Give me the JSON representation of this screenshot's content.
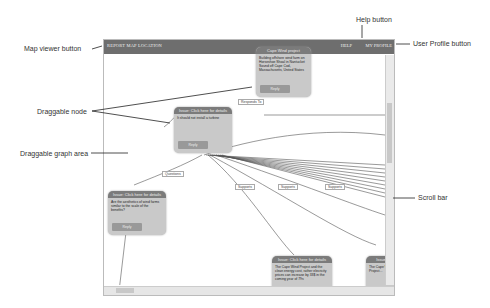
{
  "annotations": {
    "map_viewer": "Map viewer button",
    "help": "Help button",
    "user_profile": "User Profile button",
    "draggable_node": "Draggable node",
    "draggable_area": "Draggable graph area",
    "scroll_bar": "Scroll bar"
  },
  "topbar": {
    "left_button": "REPORT MAP LOCATION",
    "help": "HELP",
    "profile": "MY PROFILE"
  },
  "nodes": [
    {
      "title": "Cape Wind project",
      "body": "Building offshore wind farm on Horseshoe Shoal in Nantucket Sound off Cape Cod, Massachusetts, United States",
      "button": "Reply"
    },
    {
      "title": "Issue: Click here for details",
      "body": "It should not install a turbine",
      "button": "Reply"
    },
    {
      "title": "Issue: Click here for details",
      "body": "Are the aesthetics of wind farms similar to the scale of the benefits?",
      "button": "Reply"
    },
    {
      "title": "Issue: Click here for details",
      "body": "The Cape Wind Project and the clean energy cost, rather elecricity prices can increase by 33$ in the coming year of 79s",
      "button": "Reply"
    },
    {
      "title": "Issue",
      "body": "The Cape Wind Project...",
      "button": "Reply"
    }
  ],
  "edge_labels": {
    "responds_to": "Responds To",
    "questions": "Questions",
    "supports": "Supports"
  }
}
